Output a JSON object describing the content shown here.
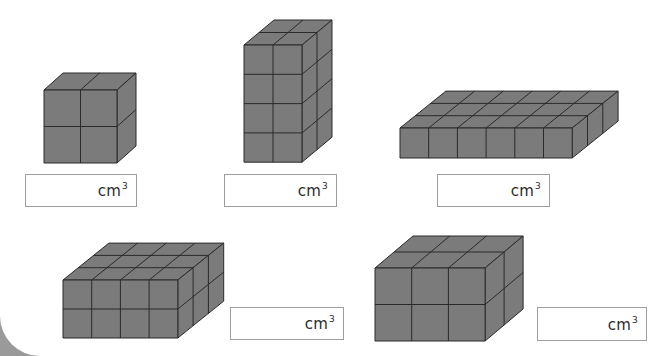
{
  "worksheet": {
    "unit_label": "cm",
    "unit_exponent": "3",
    "colors": {
      "cube_fill": "#7b7b7b",
      "cube_edge": "#2a2a2a",
      "box_border": "#9e9e9e",
      "page_bg": "#ffffff"
    },
    "shapes": [
      {
        "id": "shape-1",
        "cols": 2,
        "rows": 2,
        "depth": 1,
        "front_x": 44,
        "front_y": 90,
        "cube_w": 36.5,
        "cube_h": 36.5,
        "dx": 19,
        "dy": -17,
        "answer_box": {
          "x": 25,
          "y": 174,
          "w": 112,
          "h": 33,
          "value": ""
        }
      },
      {
        "id": "shape-2",
        "cols": 2,
        "rows": 4,
        "depth": 2,
        "front_x": 244,
        "front_y": 45,
        "cube_w": 29,
        "cube_h": 29.3,
        "dx": 15,
        "dy": -12.5,
        "answer_box": {
          "x": 224,
          "y": 174,
          "w": 113,
          "h": 33,
          "value": ""
        }
      },
      {
        "id": "shape-3",
        "cols": 6,
        "rows": 1,
        "depth": 3,
        "front_x": 400,
        "front_y": 128,
        "cube_w": 28.7,
        "cube_h": 30,
        "dx": 15.3,
        "dy": -12.3,
        "answer_box": {
          "x": 437,
          "y": 174,
          "w": 113,
          "h": 33,
          "value": ""
        }
      },
      {
        "id": "shape-4",
        "cols": 4,
        "rows": 2,
        "depth": 3,
        "front_x": 63,
        "front_y": 280,
        "cube_w": 28.7,
        "cube_h": 29,
        "dx": 15.3,
        "dy": -12.3,
        "answer_box": {
          "x": 230,
          "y": 307,
          "w": 114,
          "h": 33,
          "value": ""
        }
      },
      {
        "id": "shape-5",
        "cols": 3,
        "rows": 2,
        "depth": 2,
        "front_x": 375,
        "front_y": 268,
        "cube_w": 36.7,
        "cube_h": 36.5,
        "dx": 19,
        "dy": -16,
        "answer_box": {
          "x": 537,
          "y": 307,
          "w": 110,
          "h": 34,
          "value": ""
        }
      }
    ]
  }
}
